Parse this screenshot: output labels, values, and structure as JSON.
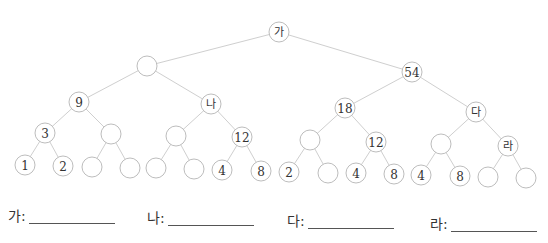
{
  "diagram": {
    "type": "binary-tree",
    "node_radius": 10,
    "colors": {
      "edge": "#cfcfcf",
      "node_stroke": "#bdbdbd",
      "text": "#333333"
    },
    "nodes": [
      {
        "id": "n1",
        "label": "가",
        "x": 279,
        "y": 32,
        "korean": true
      },
      {
        "id": "n2",
        "label": "",
        "x": 147,
        "y": 66
      },
      {
        "id": "n3",
        "label": "54",
        "x": 412,
        "y": 72
      },
      {
        "id": "n4",
        "label": "9",
        "x": 79,
        "y": 102
      },
      {
        "id": "n5",
        "label": "나",
        "x": 211,
        "y": 104,
        "korean": true
      },
      {
        "id": "n6",
        "label": "18",
        "x": 345,
        "y": 108
      },
      {
        "id": "n7",
        "label": "다",
        "x": 476,
        "y": 112,
        "korean": true
      },
      {
        "id": "n8",
        "label": "3",
        "x": 45,
        "y": 133
      },
      {
        "id": "n9",
        "label": "",
        "x": 111,
        "y": 134
      },
      {
        "id": "n10",
        "label": "",
        "x": 176,
        "y": 136
      },
      {
        "id": "n11",
        "label": "12",
        "x": 242,
        "y": 137
      },
      {
        "id": "n12",
        "label": "",
        "x": 310,
        "y": 140
      },
      {
        "id": "n13",
        "label": "12",
        "x": 376,
        "y": 142
      },
      {
        "id": "n14",
        "label": "",
        "x": 441,
        "y": 144
      },
      {
        "id": "n15",
        "label": "라",
        "x": 508,
        "y": 146,
        "korean": true
      },
      {
        "id": "n16",
        "label": "1",
        "x": 25,
        "y": 165
      },
      {
        "id": "n17",
        "label": "2",
        "x": 63,
        "y": 166
      },
      {
        "id": "n18",
        "label": "",
        "x": 92,
        "y": 167
      },
      {
        "id": "n19",
        "label": "",
        "x": 130,
        "y": 168
      },
      {
        "id": "n20",
        "label": "",
        "x": 156,
        "y": 168
      },
      {
        "id": "n21",
        "label": "",
        "x": 194,
        "y": 169
      },
      {
        "id": "n22",
        "label": "4",
        "x": 222,
        "y": 170
      },
      {
        "id": "n23",
        "label": "8",
        "x": 261,
        "y": 171
      },
      {
        "id": "n24",
        "label": "2",
        "x": 289,
        "y": 172
      },
      {
        "id": "n25",
        "label": "",
        "x": 328,
        "y": 173
      },
      {
        "id": "n26",
        "label": "4",
        "x": 356,
        "y": 173
      },
      {
        "id": "n27",
        "label": "8",
        "x": 394,
        "y": 174
      },
      {
        "id": "n28",
        "label": "4",
        "x": 421,
        "y": 175
      },
      {
        "id": "n29",
        "label": "8",
        "x": 460,
        "y": 176
      },
      {
        "id": "n30",
        "label": "",
        "x": 488,
        "y": 177
      },
      {
        "id": "n31",
        "label": "",
        "x": 526,
        "y": 178
      }
    ],
    "edges": [
      [
        "n1",
        "n2"
      ],
      [
        "n1",
        "n3"
      ],
      [
        "n2",
        "n4"
      ],
      [
        "n2",
        "n5"
      ],
      [
        "n3",
        "n6"
      ],
      [
        "n3",
        "n7"
      ],
      [
        "n4",
        "n8"
      ],
      [
        "n4",
        "n9"
      ],
      [
        "n5",
        "n10"
      ],
      [
        "n5",
        "n11"
      ],
      [
        "n6",
        "n12"
      ],
      [
        "n6",
        "n13"
      ],
      [
        "n7",
        "n14"
      ],
      [
        "n7",
        "n15"
      ],
      [
        "n8",
        "n16"
      ],
      [
        "n8",
        "n17"
      ],
      [
        "n9",
        "n18"
      ],
      [
        "n9",
        "n19"
      ],
      [
        "n10",
        "n20"
      ],
      [
        "n10",
        "n21"
      ],
      [
        "n11",
        "n22"
      ],
      [
        "n11",
        "n23"
      ],
      [
        "n12",
        "n24"
      ],
      [
        "n12",
        "n25"
      ],
      [
        "n13",
        "n26"
      ],
      [
        "n13",
        "n27"
      ],
      [
        "n14",
        "n28"
      ],
      [
        "n14",
        "n29"
      ],
      [
        "n15",
        "n30"
      ],
      [
        "n15",
        "n31"
      ]
    ]
  },
  "answers": [
    {
      "label": "가:",
      "x": 8,
      "y": 208
    },
    {
      "label": "나:",
      "x": 147,
      "y": 210
    },
    {
      "label": "다:",
      "x": 287,
      "y": 213
    },
    {
      "label": "라:",
      "x": 430,
      "y": 216
    }
  ]
}
